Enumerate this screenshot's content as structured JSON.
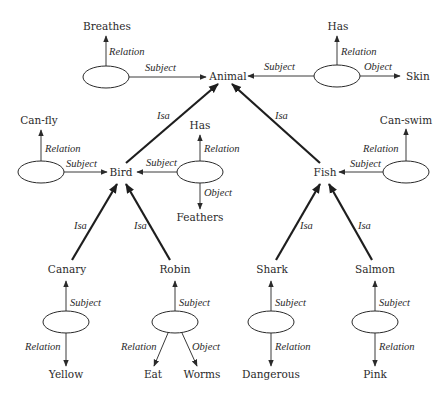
{
  "diagram": {
    "type": "semantic-network",
    "concepts": {
      "animal": "Animal",
      "bird": "Bird",
      "fish": "Fish",
      "canary": "Canary",
      "robin": "Robin",
      "shark": "Shark",
      "salmon": "Salmon"
    },
    "values": {
      "breathes": "Breathes",
      "has_top": "Has",
      "skin": "Skin",
      "can_fly": "Can-fly",
      "has_mid": "Has",
      "feathers": "Feathers",
      "can_swim": "Can-swim",
      "yellow": "Yellow",
      "eat": "Eat",
      "worms": "Worms",
      "dangerous": "Dangerous",
      "pink": "Pink"
    },
    "edge_labels": {
      "isa": "Isa",
      "subject": "Subject",
      "relation": "Relation",
      "object": "Object"
    },
    "propositions": [
      {
        "subject": "Animal",
        "relation": "Breathes"
      },
      {
        "subject": "Animal",
        "relation": "Has",
        "object": "Skin"
      },
      {
        "subject": "Bird",
        "relation": "Can-fly"
      },
      {
        "subject": "Bird",
        "relation": "Has",
        "object": "Feathers"
      },
      {
        "subject": "Fish",
        "relation": "Can-swim"
      },
      {
        "subject": "Canary",
        "relation": "Yellow"
      },
      {
        "subject": "Robin",
        "relation": "Eat",
        "object": "Worms"
      },
      {
        "subject": "Shark",
        "relation": "Dangerous"
      },
      {
        "subject": "Salmon",
        "relation": "Pink"
      }
    ],
    "isa_links": [
      {
        "from": "Bird",
        "to": "Animal"
      },
      {
        "from": "Fish",
        "to": "Animal"
      },
      {
        "from": "Canary",
        "to": "Bird"
      },
      {
        "from": "Robin",
        "to": "Bird"
      },
      {
        "from": "Shark",
        "to": "Fish"
      },
      {
        "from": "Salmon",
        "to": "Fish"
      }
    ]
  }
}
